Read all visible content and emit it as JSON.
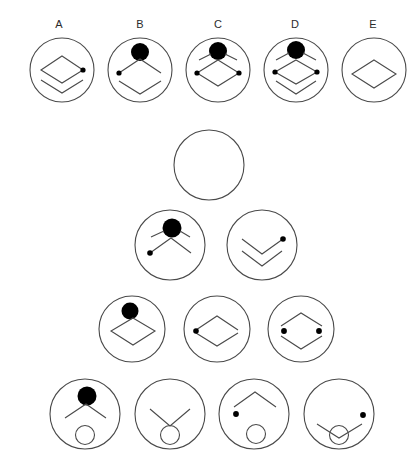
{
  "page": {
    "background_color": "#ffffff",
    "stroke_color": "#4a4a4a",
    "fill_color": "#000000",
    "width": 418,
    "height": 468
  },
  "option_labels": [
    {
      "text": "A",
      "x": 59,
      "y": 24
    },
    {
      "text": "B",
      "x": 140,
      "y": 24
    },
    {
      "text": "C",
      "x": 218,
      "y": 24
    },
    {
      "text": "D",
      "x": 295,
      "y": 24
    },
    {
      "text": "E",
      "x": 373,
      "y": 24
    }
  ],
  "rows": [
    {
      "name": "answer-options-row",
      "cy": 70,
      "r": 32,
      "tiles": [
        {
          "id": "option-a",
          "cx": 62,
          "elements": [
            "diamond-outline",
            "dot-right",
            "chevron-down-below"
          ]
        },
        {
          "id": "option-b",
          "cx": 140,
          "elements": [
            "filled-circle-top",
            "dot-left",
            "chevron-up",
            "chevron-down-below"
          ]
        },
        {
          "id": "option-c",
          "cx": 218,
          "elements": [
            "filled-circle-top",
            "angled-lines",
            "diamond-outline",
            "dot-left",
            "dot-right"
          ]
        },
        {
          "id": "option-d",
          "cx": 296,
          "elements": [
            "filled-circle-top",
            "angled-lines",
            "diamond-outline",
            "dot-left",
            "dot-right",
            "chevron-down-below"
          ]
        },
        {
          "id": "option-e",
          "cx": 374,
          "elements": [
            "diamond-outline"
          ]
        }
      ]
    },
    {
      "name": "empty-cell-row",
      "cy": 165,
      "r": 35,
      "tiles": [
        {
          "id": "empty-cell",
          "cx": 209,
          "elements": []
        }
      ]
    },
    {
      "name": "matrix-row-2",
      "cy": 245,
      "r": 35,
      "tiles": [
        {
          "id": "matrix-cell-2-1",
          "cx": 170,
          "elements": [
            "filled-circle-top",
            "angled-lines",
            "chevron-up",
            "dot-left-low"
          ]
        },
        {
          "id": "matrix-cell-2-2",
          "cx": 262,
          "elements": [
            "chevron-down",
            "chevron-down-below",
            "dot-right-upper"
          ]
        }
      ]
    },
    {
      "name": "matrix-row-3",
      "cy": 329,
      "r": 33,
      "tiles": [
        {
          "id": "matrix-cell-3-1",
          "cx": 132,
          "elements": [
            "filled-circle-top",
            "diamond-outline"
          ]
        },
        {
          "id": "matrix-cell-3-2",
          "cx": 217,
          "elements": [
            "split-diamond",
            "dot-left"
          ]
        },
        {
          "id": "matrix-cell-3-3",
          "cx": 301,
          "elements": [
            "split-diamond",
            "dot-left",
            "dot-right"
          ]
        }
      ]
    },
    {
      "name": "matrix-row-4",
      "cy": 414,
      "r": 35,
      "tiles": [
        {
          "id": "matrix-cell-4-1",
          "cx": 85,
          "elements": [
            "filled-circle-top",
            "chevron-up",
            "open-circle-bottom"
          ]
        },
        {
          "id": "matrix-cell-4-2",
          "cx": 170,
          "elements": [
            "chevron-down",
            "open-circle-bottom"
          ]
        },
        {
          "id": "matrix-cell-4-3",
          "cx": 254,
          "elements": [
            "chevron-up",
            "dot-left-low",
            "open-circle-bottom"
          ]
        },
        {
          "id": "matrix-cell-4-4",
          "cx": 339,
          "elements": [
            "shallow-chevron",
            "open-circle-center",
            "dot-right-upper"
          ]
        }
      ]
    }
  ]
}
